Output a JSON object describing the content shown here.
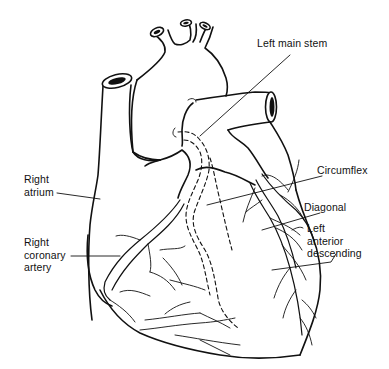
{
  "diagram": {
    "colors": {
      "line": "#111111",
      "background": "#ffffff"
    },
    "labels": {
      "left_main_stem": "Left main stem",
      "circumflex": "Circumflex",
      "diagonal": "Diagonal",
      "lad_line1": "Left",
      "lad_line2": "anterior",
      "lad_line3": "descending",
      "right_atrium_line1": "Right",
      "right_atrium_line2": "atrium",
      "rca_line1": "Right",
      "rca_line2": "coronary",
      "rca_line3": "artery"
    }
  }
}
